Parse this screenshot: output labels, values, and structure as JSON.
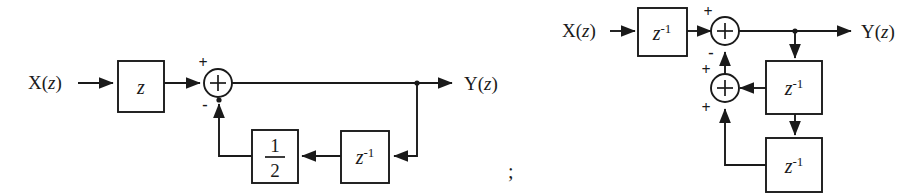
{
  "figure": {
    "separator": ";",
    "background_color": "#ffffff",
    "line_color": "#1a1a1a",
    "diagrams": [
      {
        "id": "diagram-left",
        "input_label": "X(z)",
        "input_label_main": "X(",
        "input_label_var": "z",
        "input_label_end": ")",
        "output_label": "Y(z)",
        "output_label_main": "Y(",
        "output_label_var": "z",
        "output_label_end": ")",
        "forward_block": {
          "name": "advance-block",
          "base": "z",
          "exponent": ""
        },
        "summer": {
          "name": "summing-junction",
          "glyph": "+",
          "input_sign_left": "+",
          "input_sign_bottom": "-"
        },
        "feedback_blocks": [
          {
            "name": "gain-one-half-block",
            "numerator": "1",
            "denominator": "2"
          },
          {
            "name": "delay-block",
            "base": "z",
            "exponent": "-1"
          }
        ]
      },
      {
        "id": "diagram-right",
        "input_label": "X(z)",
        "input_label_main": "X(",
        "input_label_var": "z",
        "input_label_end": ")",
        "output_label": "Y(z)",
        "output_label_main": "Y(",
        "output_label_var": "z",
        "output_label_end": ")",
        "forward_block": {
          "name": "delay-block-input",
          "base": "z",
          "exponent": "-1"
        },
        "summer_top": {
          "name": "summing-junction-top",
          "glyph": "+",
          "input_sign_left": "+",
          "input_sign_bottom": "-"
        },
        "summer_lower": {
          "name": "summing-junction-lower",
          "glyph": "+",
          "input_sign_upper": "+",
          "input_sign_lower": "+"
        },
        "feedback_blocks": [
          {
            "name": "delay-block-first",
            "base": "z",
            "exponent": "-1"
          },
          {
            "name": "delay-block-second",
            "base": "z",
            "exponent": "-1"
          }
        ]
      }
    ]
  }
}
